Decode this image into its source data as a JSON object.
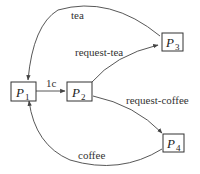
{
  "diagram": {
    "type": "state-transition",
    "nodes": [
      {
        "id": "P1",
        "label": "P",
        "sub": "1"
      },
      {
        "id": "P2",
        "label": "P",
        "sub": "2"
      },
      {
        "id": "P3",
        "label": "P",
        "sub": "3"
      },
      {
        "id": "P4",
        "label": "P",
        "sub": "4"
      }
    ],
    "edges": [
      {
        "from": "P1",
        "to": "P2",
        "label": "1c"
      },
      {
        "from": "P2",
        "to": "P3",
        "label": "request-tea"
      },
      {
        "from": "P2",
        "to": "P4",
        "label": "request-coffee"
      },
      {
        "from": "P3",
        "to": "P1",
        "label": "tea"
      },
      {
        "from": "P4",
        "to": "P1",
        "label": "coffee"
      }
    ]
  }
}
